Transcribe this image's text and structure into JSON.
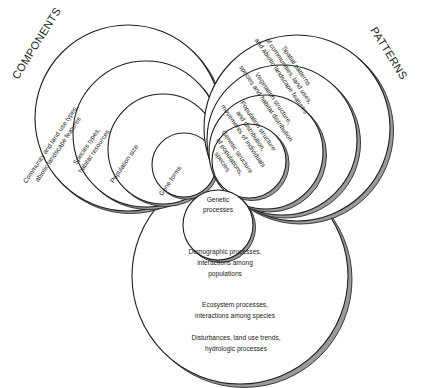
{
  "titles": {
    "components": "COMPONENTS",
    "patterns": "PATTERNS"
  },
  "components": [
    {
      "lines": [
        "Community and land use types,",
        "abiotic landscape features"
      ]
    },
    {
      "lines": [
        "Species types,",
        "habitat resources"
      ]
    },
    {
      "lines": [
        "Population size"
      ]
    },
    {
      "lines": [
        "Gene forms"
      ]
    }
  ],
  "patterns": [
    {
      "lines": [
        "Spatial patterns",
        "of communities, land uses,",
        "and abiotic landscape features"
      ]
    },
    {
      "lines": [
        "Vegetation structure,",
        "species and habitat distribution"
      ]
    },
    {
      "lines": [
        "Population structure",
        "and distribution,",
        "movements of individuals"
      ]
    },
    {
      "lines": [
        "Genetic structure",
        "of populations,",
        "species"
      ]
    }
  ],
  "processes": [
    {
      "lines": [
        "Genetic",
        "processes"
      ]
    },
    {
      "lines": [
        "Demographic processes,",
        "interactions among",
        "populations"
      ]
    },
    {
      "lines": [
        "Ecosystem processes,",
        "interactions among species"
      ]
    },
    {
      "lines": [
        "Disturbances, land use trends,",
        "hydrologic processes"
      ]
    }
  ]
}
